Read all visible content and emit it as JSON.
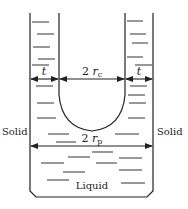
{
  "diagram": {
    "labels": {
      "left_solid": "Solid",
      "right_solid": "Solid",
      "liquid": "Liquid",
      "thickness_left": "t",
      "thickness_right": "t",
      "cell_diameter_prefix": "2 ",
      "cell_diameter_var": "r",
      "cell_diameter_sub": "c",
      "pore_diameter_prefix": "2 ",
      "pore_diameter_var": "r",
      "pore_diameter_sub": "p"
    },
    "colors": {
      "line": "#222222",
      "background": "#ffffff"
    }
  }
}
